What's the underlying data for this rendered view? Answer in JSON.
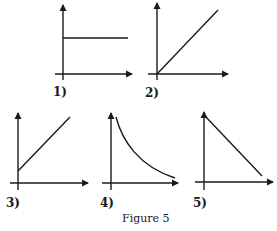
{
  "figure": {
    "caption": "Figure 5",
    "panels": [
      {
        "id": 1,
        "label": "1)",
        "shape": "horizontal line (constant, positive intercept)"
      },
      {
        "id": 2,
        "label": "2)",
        "shape": "straight line through origin (direct proportion)"
      },
      {
        "id": 3,
        "label": "3)",
        "shape": "straight line with positive intercept, positive slope"
      },
      {
        "id": 4,
        "label": "4)",
        "shape": "decreasing curve (inverse relation)"
      },
      {
        "id": 5,
        "label": "5)",
        "shape": "straight line with negative slope"
      }
    ]
  },
  "colors": {
    "ink": "#1a1a1a",
    "background": "#ffffff"
  }
}
